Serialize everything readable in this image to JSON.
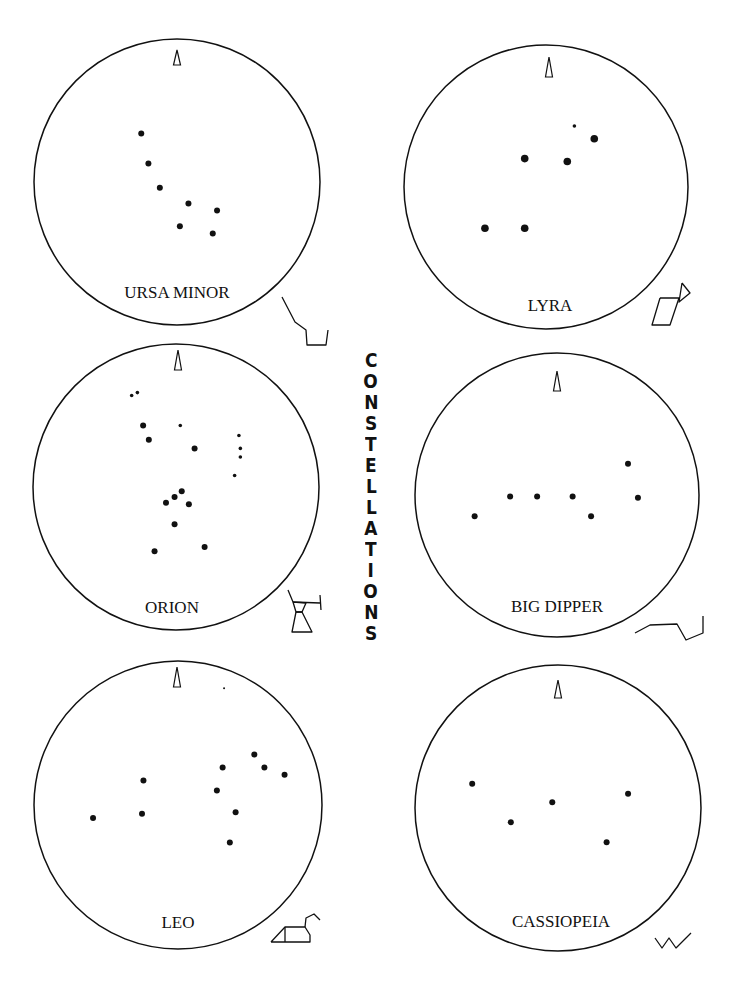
{
  "title": "CONSTELLATIONS",
  "north_marker": "north-arrow",
  "charts": [
    {
      "id": "ursa-minor",
      "name": "URSA MINOR",
      "stars": [
        {
          "x": -0.25,
          "y": -0.34,
          "mag": "m"
        },
        {
          "x": -0.2,
          "y": -0.13,
          "mag": "m"
        },
        {
          "x": -0.12,
          "y": 0.04,
          "mag": "m"
        },
        {
          "x": 0.08,
          "y": 0.15,
          "mag": "m"
        },
        {
          "x": 0.28,
          "y": 0.2,
          "mag": "m"
        },
        {
          "x": 0.02,
          "y": 0.31,
          "mag": "m"
        },
        {
          "x": 0.25,
          "y": 0.36,
          "mag": "m"
        }
      ],
      "figure": [
        [
          [
            0,
            0
          ],
          [
            13,
            25
          ],
          [
            24,
            33
          ],
          [
            25,
            48
          ],
          [
            44,
            48
          ],
          [
            46,
            33
          ]
        ]
      ]
    },
    {
      "id": "lyra",
      "name": "LYRA",
      "stars": [
        {
          "x": 0.2,
          "y": -0.43,
          "mag": "s"
        },
        {
          "x": 0.34,
          "y": -0.34,
          "mag": "l"
        },
        {
          "x": -0.15,
          "y": -0.2,
          "mag": "l"
        },
        {
          "x": 0.15,
          "y": -0.18,
          "mag": "l"
        },
        {
          "x": -0.43,
          "y": 0.29,
          "mag": "l"
        },
        {
          "x": -0.15,
          "y": 0.29,
          "mag": "l"
        }
      ],
      "figure": [
        [
          [
            30,
            0
          ],
          [
            38,
            10
          ],
          [
            27,
            19
          ],
          [
            30,
            0
          ]
        ],
        [
          [
            8,
            15
          ],
          [
            27,
            15
          ],
          [
            18,
            42
          ],
          [
            0,
            42
          ],
          [
            8,
            15
          ]
        ]
      ]
    },
    {
      "id": "orion",
      "name": "ORION",
      "stars": [
        {
          "x": -0.31,
          "y": -0.64,
          "mag": "s"
        },
        {
          "x": -0.27,
          "y": -0.66,
          "mag": "s"
        },
        {
          "x": -0.23,
          "y": -0.43,
          "mag": "m"
        },
        {
          "x": -0.19,
          "y": -0.33,
          "mag": "m"
        },
        {
          "x": 0.03,
          "y": -0.43,
          "mag": "s"
        },
        {
          "x": 0.13,
          "y": -0.27,
          "mag": "m"
        },
        {
          "x": 0.44,
          "y": -0.36,
          "mag": "s"
        },
        {
          "x": 0.45,
          "y": -0.27,
          "mag": "s"
        },
        {
          "x": 0.45,
          "y": -0.21,
          "mag": "s"
        },
        {
          "x": 0.41,
          "y": -0.08,
          "mag": "s"
        },
        {
          "x": 0.04,
          "y": 0.03,
          "mag": "m"
        },
        {
          "x": -0.01,
          "y": 0.07,
          "mag": "m"
        },
        {
          "x": -0.07,
          "y": 0.11,
          "mag": "m"
        },
        {
          "x": 0.09,
          "y": 0.12,
          "mag": "m"
        },
        {
          "x": -0.01,
          "y": 0.26,
          "mag": "m"
        },
        {
          "x": -0.15,
          "y": 0.45,
          "mag": "m"
        },
        {
          "x": 0.2,
          "y": 0.42,
          "mag": "m"
        }
      ],
      "figure": [
        [
          [
            0,
            0
          ],
          [
            5,
            12
          ],
          [
            32,
            13
          ]
        ],
        [
          [
            32,
            5
          ],
          [
            33,
            20
          ]
        ],
        [
          [
            5,
            12
          ],
          [
            18,
            13
          ],
          [
            14,
            22
          ],
          [
            8,
            22
          ],
          [
            5,
            12
          ]
        ],
        [
          [
            8,
            22
          ],
          [
            14,
            22
          ],
          [
            24,
            42
          ],
          [
            4,
            42
          ],
          [
            8,
            22
          ]
        ]
      ]
    },
    {
      "id": "big-dipper",
      "name": "BIG DIPPER",
      "stars": [
        {
          "x": -0.58,
          "y": 0.15,
          "mag": "m"
        },
        {
          "x": -0.33,
          "y": 0.01,
          "mag": "m"
        },
        {
          "x": -0.14,
          "y": 0.01,
          "mag": "m"
        },
        {
          "x": 0.11,
          "y": 0.01,
          "mag": "m"
        },
        {
          "x": 0.24,
          "y": 0.15,
          "mag": "m"
        },
        {
          "x": 0.5,
          "y": -0.22,
          "mag": "m"
        },
        {
          "x": 0.57,
          "y": 0.02,
          "mag": "m"
        }
      ],
      "figure": [
        [
          [
            0,
            17
          ],
          [
            15,
            9
          ],
          [
            42,
            8
          ],
          [
            51,
            24
          ],
          [
            68,
            17
          ],
          [
            68,
            0
          ]
        ]
      ]
    },
    {
      "id": "leo",
      "name": "LEO",
      "stars": [
        {
          "x": 0.32,
          "y": -0.81,
          "mag": "t"
        },
        {
          "x": -0.59,
          "y": 0.09,
          "mag": "m"
        },
        {
          "x": -0.24,
          "y": -0.17,
          "mag": "m"
        },
        {
          "x": -0.25,
          "y": 0.06,
          "mag": "m"
        },
        {
          "x": 0.31,
          "y": -0.26,
          "mag": "m"
        },
        {
          "x": 0.27,
          "y": -0.1,
          "mag": "m"
        },
        {
          "x": 0.4,
          "y": 0.05,
          "mag": "m"
        },
        {
          "x": 0.36,
          "y": 0.26,
          "mag": "m"
        },
        {
          "x": 0.53,
          "y": -0.35,
          "mag": "m"
        },
        {
          "x": 0.6,
          "y": -0.26,
          "mag": "m"
        },
        {
          "x": 0.74,
          "y": -0.21,
          "mag": "m"
        }
      ],
      "figure": [
        [
          [
            0,
            28
          ],
          [
            14,
            13
          ],
          [
            34,
            13
          ],
          [
            39,
            21
          ],
          [
            39,
            28
          ],
          [
            0,
            28
          ]
        ],
        [
          [
            14,
            13
          ],
          [
            14,
            28
          ]
        ],
        [
          [
            34,
            13
          ],
          [
            35,
            4
          ],
          [
            43,
            0
          ],
          [
            49,
            6
          ]
        ]
      ]
    },
    {
      "id": "cassiopeia",
      "name": "CASSIOPEIA",
      "stars": [
        {
          "x": -0.6,
          "y": -0.17,
          "mag": "m"
        },
        {
          "x": -0.33,
          "y": 0.1,
          "mag": "m"
        },
        {
          "x": -0.04,
          "y": -0.04,
          "mag": "m"
        },
        {
          "x": 0.34,
          "y": 0.24,
          "mag": "m"
        },
        {
          "x": 0.49,
          "y": -0.1,
          "mag": "m"
        }
      ],
      "figure": [
        [
          [
            0,
            5
          ],
          [
            7,
            15
          ],
          [
            14,
            5
          ],
          [
            21,
            15
          ],
          [
            36,
            0
          ]
        ]
      ]
    }
  ]
}
